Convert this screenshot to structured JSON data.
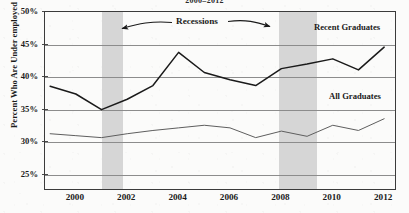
{
  "title": "2000–2012",
  "axes": {
    "ylabel": "Percent Who Are Under employed",
    "yticks": [
      "25%",
      "30%",
      "35%",
      "40%",
      "45%",
      "50%"
    ],
    "xticks": [
      "2000",
      "2002",
      "2004",
      "2006",
      "2008",
      "2010",
      "2012"
    ]
  },
  "annotations": {
    "recessions": "Recessions",
    "recent_graduates": "Recent Graduates",
    "all_graduates": "All Graduates"
  },
  "colors": {
    "recent_line": "#1a1a1a",
    "all_line": "#5e5e5e",
    "recession_band": "#d2d2d2",
    "grid": "#8c8c8c",
    "axis": "#3b3b3b",
    "background": "#fbfbfa"
  },
  "chart_data": {
    "type": "line",
    "title": "2000–2012",
    "xlabel": "",
    "ylabel": "Percent Who Are Under employed",
    "xlim": [
      1998.8,
      2012.5
    ],
    "ylim": [
      22.5,
      50
    ],
    "grid": true,
    "legend": "inline-labels",
    "x": [
      1999,
      2000,
      2001,
      2002,
      2003,
      2004,
      2005,
      2006,
      2007,
      2008,
      2009,
      2010,
      2011,
      2012
    ],
    "series": [
      {
        "name": "Recent Graduates",
        "color": "#1a1a1a",
        "values": [
          38.6,
          37.4,
          35.0,
          36.6,
          38.7,
          43.8,
          40.7,
          39.6,
          38.7,
          41.3,
          42.0,
          42.8,
          41.1,
          44.6
        ]
      },
      {
        "name": "All Graduates",
        "color": "#5e5e5e",
        "values": [
          31.3,
          31.0,
          30.7,
          31.3,
          31.8,
          32.2,
          32.6,
          32.2,
          30.7,
          31.7,
          30.9,
          32.6,
          31.8,
          33.6
        ]
      }
    ],
    "shaded_regions": [
      {
        "label": "Recessions",
        "start": 2001.0,
        "end": 2001.85
      },
      {
        "label": "Recessions",
        "start": 2007.9,
        "end": 2009.4
      }
    ]
  }
}
